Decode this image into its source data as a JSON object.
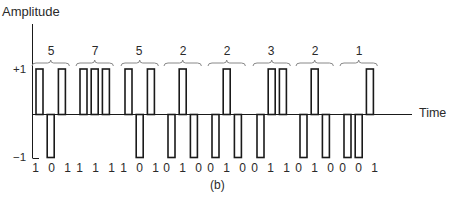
{
  "figure": {
    "caption": "(b)",
    "y_axis_label": "Amplitude",
    "x_axis_label": "Time",
    "y_ticks": [
      {
        "label": "+1",
        "value": 1
      },
      {
        "label": "−1",
        "value": -1
      }
    ],
    "colors": {
      "stroke": "#1a1a1a",
      "brace": "#888888",
      "text": "#2a2a2a"
    }
  },
  "encoding": {
    "description": "Each decimal value encoded as 3-bit group; bit 1 = positive pulse (+1), bit 0 = negative pulse (-1)",
    "groups": [
      {
        "value": "5",
        "bits": "1 0 1"
      },
      {
        "value": "7",
        "bits": "1 1 1"
      },
      {
        "value": "5",
        "bits": "1 0 1"
      },
      {
        "value": "2",
        "bits": "0 1 0"
      },
      {
        "value": "2",
        "bits": "0 1 0"
      },
      {
        "value": "3",
        "bits": "0 1 1"
      },
      {
        "value": "2",
        "bits": "0 1 0"
      },
      {
        "value": "1",
        "bits": "0 0 1"
      }
    ]
  }
}
